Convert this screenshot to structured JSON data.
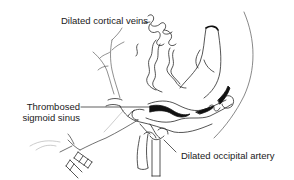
{
  "figure": {
    "type": "anatomical illustration",
    "style": "black line drawing on white",
    "colors": {
      "background": "#ffffff",
      "line": "#2a2a2a",
      "thrombus_fill": "#111111",
      "text": "#1a1a1a"
    }
  },
  "labels": {
    "veins": "Dilated cortical veins",
    "sinus_line1": "Thrombosed",
    "sinus_line2": "sigmoid sinus",
    "artery": "Dilated occipital artery"
  }
}
